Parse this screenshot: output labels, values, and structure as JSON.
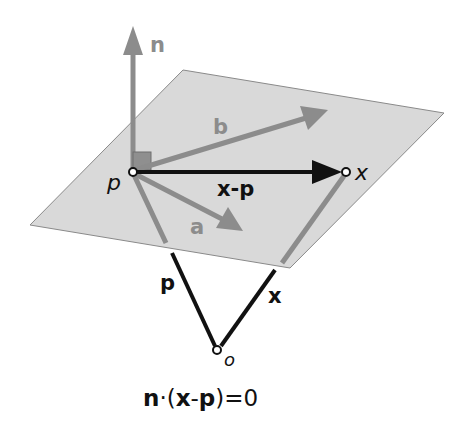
{
  "diagram": {
    "type": "plane-point-normal",
    "colors": {
      "plane_fill": "#d9d9d9",
      "plane_edge": "#8a8a8a",
      "gray_vector": "#8c8c8c",
      "black_vector": "#111111",
      "right_angle_fill": "#8f8f8f",
      "text_black": "#111111",
      "text_gray": "#8c8c8c"
    },
    "labels": {
      "n": "n",
      "b": "b",
      "a": "a",
      "p_point": "p",
      "x_point": "x",
      "x_minus_p": "x-p",
      "p_vector": "p",
      "x_vector": "x",
      "origin": "o"
    },
    "equation": {
      "n": "n",
      "dot": "·(",
      "x": "x",
      "minus": "-",
      "p": "p",
      "tail": ")=0"
    }
  }
}
